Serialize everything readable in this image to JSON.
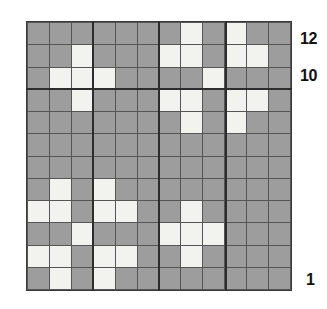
{
  "figure": {
    "type": "grid-plot",
    "title": "",
    "colors": {
      "filled_cell": "#f2f2ee",
      "empty_cell": "#9d9d9d",
      "gridline": "#555555",
      "major_gridline": "#2d2d2d",
      "label_text": "#111111",
      "background": "#ffffff"
    }
  },
  "axis": {
    "right_labels": [
      {
        "text": "12",
        "row": 12
      },
      {
        "text": "10",
        "row": 10
      },
      {
        "text": "1",
        "row": 1
      }
    ]
  },
  "chart_data": {
    "type": "heatmap",
    "title": "",
    "xlabel": "",
    "ylabel": "",
    "rows": 12,
    "cols": 12,
    "xlim": [
      1,
      12
    ],
    "ylim": [
      1,
      12
    ],
    "grid": true,
    "legend": null,
    "value_labels": {
      "0": "empty",
      "1": "filled"
    },
    "categories_x": [
      1,
      2,
      3,
      4,
      5,
      6,
      7,
      8,
      9,
      10,
      11,
      12
    ],
    "categories_y": [
      12,
      11,
      10,
      9,
      8,
      7,
      6,
      5,
      4,
      3,
      2,
      1
    ],
    "values": [
      [
        0,
        0,
        0,
        0,
        0,
        0,
        0,
        1,
        0,
        1,
        0,
        0
      ],
      [
        0,
        0,
        1,
        0,
        0,
        0,
        1,
        1,
        0,
        1,
        1,
        0
      ],
      [
        0,
        1,
        1,
        1,
        0,
        0,
        0,
        0,
        1,
        0,
        0,
        0
      ],
      [
        0,
        0,
        1,
        0,
        0,
        0,
        1,
        1,
        0,
        1,
        1,
        0
      ],
      [
        0,
        0,
        0,
        0,
        0,
        0,
        0,
        1,
        0,
        1,
        0,
        0
      ],
      [
        0,
        0,
        0,
        0,
        0,
        0,
        0,
        0,
        0,
        0,
        0,
        0
      ],
      [
        0,
        0,
        0,
        0,
        0,
        0,
        0,
        0,
        0,
        0,
        0,
        0
      ],
      [
        0,
        1,
        0,
        1,
        0,
        0,
        0,
        0,
        0,
        0,
        0,
        0
      ],
      [
        1,
        1,
        0,
        1,
        1,
        0,
        0,
        1,
        0,
        0,
        0,
        0
      ],
      [
        0,
        0,
        1,
        0,
        0,
        0,
        1,
        1,
        1,
        0,
        0,
        0
      ],
      [
        1,
        1,
        0,
        1,
        1,
        0,
        0,
        1,
        0,
        0,
        0,
        0
      ],
      [
        0,
        1,
        0,
        1,
        0,
        0,
        0,
        0,
        0,
        0,
        0,
        0
      ]
    ],
    "row_labels_shown": [
      "12",
      "10",
      "1"
    ],
    "major_dividers": {
      "cols_after": [
        2,
        5,
        8
      ],
      "rows_after": [
        2
      ]
    }
  }
}
